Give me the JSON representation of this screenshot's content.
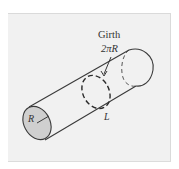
{
  "figure": {
    "labels": {
      "girth_title": "Girth",
      "girth_formula": "2πR",
      "radius": "R",
      "length": "L"
    },
    "colors": {
      "panel_bg": "#f1f1f1",
      "cap_fill": "#cfcfcf",
      "stroke": "#3a3a3a",
      "text": "#333333"
    }
  }
}
